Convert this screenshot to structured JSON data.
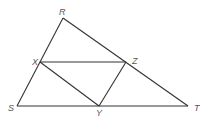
{
  "diagram": {
    "points": {
      "R": {
        "label": "R",
        "x": 63,
        "y": 18,
        "lx": 59,
        "ly": 15
      },
      "X": {
        "label": "X",
        "x": 40,
        "y": 62,
        "lx": 32,
        "ly": 65
      },
      "Z": {
        "label": "Z",
        "x": 126,
        "y": 62,
        "lx": 132,
        "ly": 64
      },
      "S": {
        "label": "S",
        "x": 17,
        "y": 106,
        "lx": 8,
        "ly": 111
      },
      "Y": {
        "label": "Y",
        "x": 99,
        "y": 106,
        "lx": 96,
        "ly": 116
      },
      "T": {
        "label": "T",
        "x": 188,
        "y": 106,
        "lx": 194,
        "ly": 111
      }
    },
    "segments": [
      [
        "R",
        "S"
      ],
      [
        "R",
        "T"
      ],
      [
        "S",
        "T"
      ],
      [
        "X",
        "Z"
      ],
      [
        "X",
        "Y"
      ],
      [
        "Z",
        "Y"
      ]
    ],
    "colors": {
      "line": "#333333",
      "label": "#555555"
    }
  }
}
